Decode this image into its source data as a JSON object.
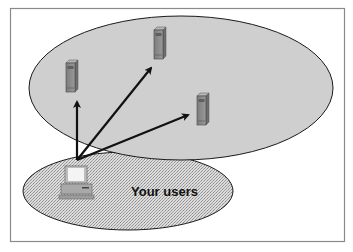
{
  "diagram": {
    "type": "network-topology",
    "frame": {
      "border_color": "#8a8a8a",
      "background": "#ffffff"
    },
    "regions": [
      {
        "id": "servers-region",
        "label": "",
        "fill": "#cfcfcf",
        "stroke": "#1a1a1a"
      },
      {
        "id": "users-region",
        "label": "Your users",
        "fill": "#d6d6d6",
        "pattern": "stipple",
        "stroke": "#1a1a1a"
      }
    ],
    "nodes": [
      {
        "id": "server-1",
        "kind": "server",
        "region": "servers-region"
      },
      {
        "id": "server-2",
        "kind": "server",
        "region": "servers-region"
      },
      {
        "id": "server-3",
        "kind": "server",
        "region": "servers-region"
      },
      {
        "id": "user-pc",
        "kind": "desktop-computer",
        "region": "users-region"
      }
    ],
    "edges": [
      {
        "from": "user-pc",
        "to": "server-1",
        "directed": true
      },
      {
        "from": "user-pc",
        "to": "server-2",
        "directed": true
      },
      {
        "from": "user-pc",
        "to": "server-3",
        "directed": true
      }
    ],
    "users_label": "Your users"
  }
}
